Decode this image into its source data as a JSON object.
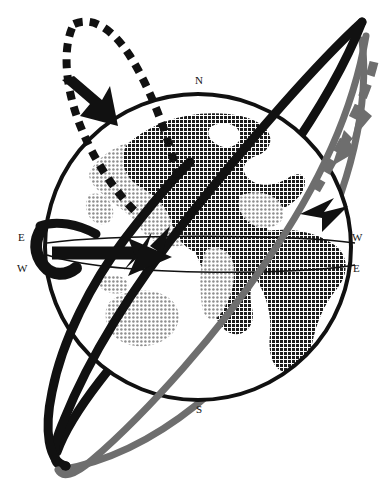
{
  "figure": {
    "background_color": "#ffffff",
    "width": 385,
    "height": 492
  },
  "globe": {
    "center_x": 198,
    "center_y": 247,
    "radius": 155,
    "outline_color": "#111111",
    "outline_width": 4,
    "fill_color": "#ffffff",
    "landmass_dark_color": "#1c1c1c",
    "landmass_light_color": "#a8a8a8",
    "equator_band_color": "#111111",
    "equator_band_width": 1.6
  },
  "compass": {
    "north": "N",
    "south": "S",
    "east_left": "E",
    "west_left": "W",
    "west_right": "W",
    "east_right": "E"
  },
  "orbits": [
    {
      "name": "tilted-black-orbit-ring",
      "color": "#111111",
      "style": "solid",
      "stroke_width": 9
    },
    {
      "name": "gray-orbit-ring",
      "color": "#6e6e6e",
      "style": "solid",
      "stroke_width": 7
    }
  ],
  "trajectories": [
    {
      "name": "black-dashed-trajectory",
      "color": "#111111",
      "style": "dashed",
      "stroke_width": 8,
      "dash_pattern": "9 7",
      "arrow_direction": "down-right"
    },
    {
      "name": "gray-dashed-trajectory",
      "color": "#6e6e6e",
      "style": "dashed",
      "stroke_width": 8,
      "dash_pattern": "14 9",
      "arrow_direction": "down-left"
    }
  ],
  "arrows": [
    {
      "name": "equatorial-rotation-arrow",
      "color": "#111111",
      "direction": "right"
    },
    {
      "name": "dashed-path-arrowhead",
      "color": "#111111",
      "direction": "down-right"
    },
    {
      "name": "gray-path-arrowhead",
      "color": "#6e6e6e",
      "direction": "down-left"
    },
    {
      "name": "inbound-arrowhead",
      "color": "#111111",
      "direction": "up-right"
    }
  ]
}
